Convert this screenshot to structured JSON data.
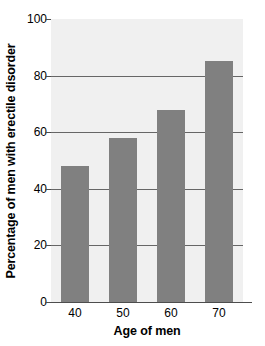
{
  "chart_data": {
    "type": "bar",
    "title": "",
    "categories": [
      "40",
      "50",
      "60",
      "70"
    ],
    "values": [
      48,
      58,
      68,
      85
    ],
    "series": [
      {
        "name": "Percentage of men with erectile disorder",
        "values": [
          48,
          58,
          68,
          85
        ]
      }
    ],
    "xlabel": "Age of men",
    "ylabel": "Percentage of men with erectile disorder",
    "ylim": [
      0,
      100
    ],
    "yticks": [
      0,
      20,
      40,
      60,
      80,
      100
    ],
    "ytick_labels": [
      "0",
      "20",
      "40",
      "60",
      "80",
      "100"
    ],
    "grid": true,
    "grid_axis": "y",
    "legend": false,
    "legend_position": "none",
    "bar_color": "#808080",
    "plot_background": "#f0f0f0",
    "gridline_color": "#666666",
    "axis_color": "#4d4d4d",
    "text_color": "#000000"
  },
  "axes": {
    "y_title": "Percentage of men with erectile disorder",
    "x_title": "Age of men",
    "y_tick_0": "0",
    "y_tick_1": "20",
    "y_tick_2": "40",
    "y_tick_3": "60",
    "y_tick_4": "80",
    "y_tick_5": "100",
    "x_tick_0": "40",
    "x_tick_1": "50",
    "x_tick_2": "60",
    "x_tick_3": "70"
  }
}
